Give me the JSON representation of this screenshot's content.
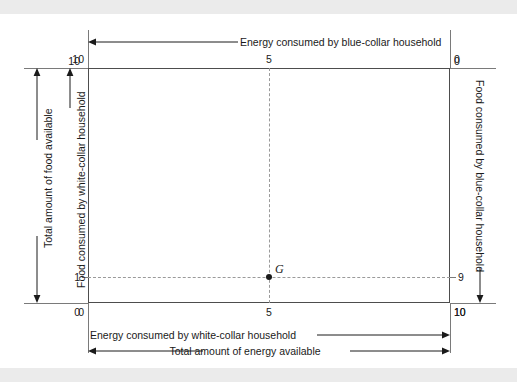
{
  "figure": {
    "type": "edgeworth-box-diagram",
    "point": {
      "name": "G",
      "label": "G"
    },
    "top_axis": {
      "label": "Energy consumed by blue-collar household",
      "ticks": [
        "10",
        "5",
        "0"
      ],
      "direction": "right-to-left"
    },
    "bottom_axis": {
      "label": "Energy consumed by white-collar household",
      "total_label": "Total amount of energy available",
      "ticks": [
        "0",
        "5",
        "10"
      ],
      "direction": "left-to-right"
    },
    "left_axis": {
      "label": "Food consumed by white-collar household",
      "total_label": "Total amount of food available",
      "ticks": [
        "10",
        "1",
        "0"
      ],
      "direction": "top-to-bottom"
    },
    "right_axis": {
      "label": "Food consumed by blue-collar household",
      "ticks": [
        "0",
        "9",
        "10"
      ],
      "direction": "top-to-bottom"
    },
    "colors": {
      "ink": "#1a1a1a",
      "box_border": "#4d4d4d",
      "rule": "#7a7a7a",
      "dash": "#9a9a9a",
      "band": "#ebebeb",
      "background": "#ffffff"
    }
  }
}
